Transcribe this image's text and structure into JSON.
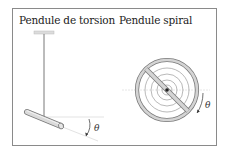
{
  "figure": {
    "left_panel": {
      "title": "Pendule de torsion",
      "angle_label": "θ"
    },
    "right_panel": {
      "title": "Pendule spiral",
      "angle_label": "θ"
    }
  },
  "colors": {
    "frame": "#8a8a8a",
    "rod_fill": "#d9d9d9",
    "rod_stroke": "#7a7a7a",
    "wire": "#555555",
    "reference_line": "#e6e6e6",
    "text": "#222222"
  }
}
